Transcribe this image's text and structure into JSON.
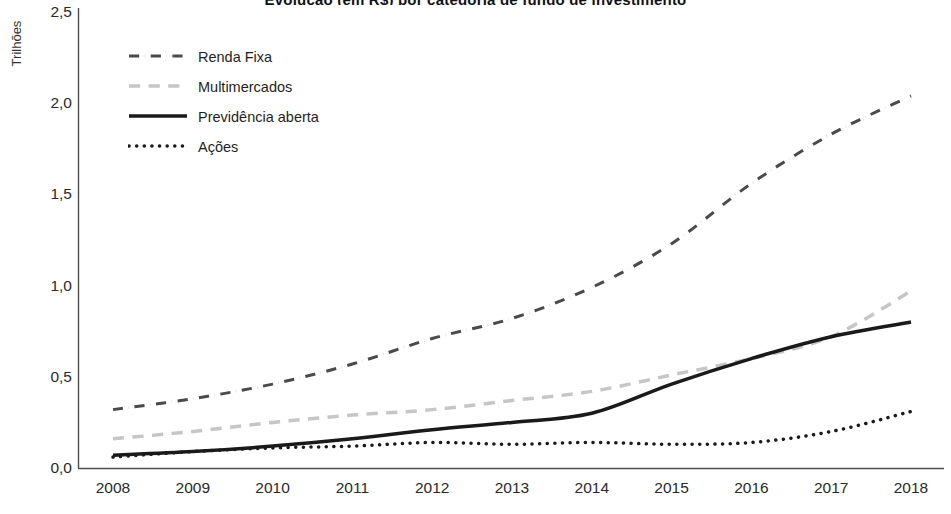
{
  "chart_data": {
    "type": "line",
    "title": "Evolução (em R$) por categoria de fundo de investimento",
    "xlabel": "",
    "ylabel": "Trilhões",
    "x": [
      2008,
      2009,
      2010,
      2011,
      2012,
      2013,
      2014,
      2015,
      2016,
      2017,
      2018
    ],
    "xtick_labels": [
      "2008",
      "2009",
      "2010",
      "2011",
      "2012",
      "2013",
      "2014",
      "2015",
      "2016",
      "2017",
      "2018"
    ],
    "ytick_labels": [
      "0,0",
      "0,5",
      "1,0",
      "1,5",
      "2,0",
      "2,5"
    ],
    "ytick_values": [
      0.0,
      0.5,
      1.0,
      1.5,
      2.0,
      2.5
    ],
    "ylim": [
      0.0,
      2.5
    ],
    "xlim": [
      2008,
      2018
    ],
    "grid": false,
    "legend_position": "upper-left-inside",
    "series": [
      {
        "name": "Renda Fixa",
        "style": "dash-dot",
        "color": "#4a4a4a",
        "width": 3,
        "values": [
          0.32,
          0.38,
          0.46,
          0.57,
          0.71,
          0.82,
          0.99,
          1.23,
          1.56,
          1.83,
          2.04
        ]
      },
      {
        "name": "Multimercados",
        "style": "dashed",
        "color": "#c6c6c6",
        "width": 3.5,
        "values": [
          0.16,
          0.2,
          0.25,
          0.29,
          0.32,
          0.37,
          0.42,
          0.51,
          0.6,
          0.72,
          0.97
        ]
      },
      {
        "name": "Previdência aberta",
        "style": "solid",
        "color": "#1a1a1a",
        "width": 3.5,
        "values": [
          0.07,
          0.09,
          0.12,
          0.16,
          0.21,
          0.25,
          0.3,
          0.46,
          0.6,
          0.72,
          0.8
        ]
      },
      {
        "name": "Ações",
        "style": "dotted",
        "color": "#1a1a1a",
        "width": 3.5,
        "values": [
          0.06,
          0.09,
          0.11,
          0.12,
          0.14,
          0.13,
          0.14,
          0.13,
          0.14,
          0.2,
          0.31
        ]
      }
    ]
  },
  "legend": {
    "items": [
      {
        "label": "Renda Fixa"
      },
      {
        "label": "Multimercados"
      },
      {
        "label": "Previdência aberta"
      },
      {
        "label": "Ações"
      }
    ]
  },
  "axes": {
    "y_title": "Trilhões"
  }
}
